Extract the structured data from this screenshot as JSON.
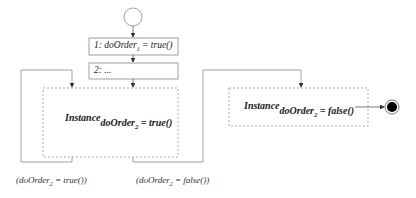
{
  "diagram": {
    "type": "activity-diagram",
    "start_node": {
      "name": "initial-state"
    },
    "actions": [
      {
        "id": "action-1",
        "prefix": "1:",
        "var": "doOrder",
        "sub": "1",
        "rest": "= true()"
      },
      {
        "id": "action-2",
        "prefix": "2:",
        "text": "..."
      }
    ],
    "instances": [
      {
        "id": "instance-true",
        "label": "Instance",
        "var": "doOrder",
        "sub": "2",
        "rest": "= true()"
      },
      {
        "id": "instance-false",
        "label": "Instance",
        "var": "doOrder",
        "sub": "2",
        "rest": "= false()"
      }
    ],
    "guards": [
      {
        "id": "guard-true",
        "open": "(doOrder",
        "sub": "2",
        "rest": "= true())"
      },
      {
        "id": "guard-false",
        "open": "(doOrder",
        "sub": "2",
        "rest": "= false())"
      }
    ],
    "end_node": {
      "name": "final-state"
    },
    "colors": {
      "line": "#777777",
      "dashed": "#9a9a9a",
      "text": "#222222",
      "final": "#000000"
    }
  }
}
